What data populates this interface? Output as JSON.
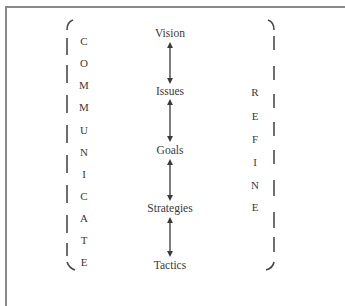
{
  "diagram": {
    "type": "flow",
    "left_label": {
      "word": "COMMUNICATE",
      "letters": [
        "C",
        "O",
        "M",
        "M",
        "U",
        "N",
        "I",
        "C",
        "A",
        "T",
        "E"
      ]
    },
    "right_label": {
      "word": "REFINE",
      "letters": [
        "R",
        "E",
        "F",
        "I",
        "N",
        "E"
      ]
    },
    "nodes": [
      {
        "id": "vision",
        "label": "Vision"
      },
      {
        "id": "issues",
        "label": "Issues"
      },
      {
        "id": "goals",
        "label": "Goals"
      },
      {
        "id": "strategies",
        "label": "Strategies"
      },
      {
        "id": "tactics",
        "label": "Tactics"
      }
    ],
    "edges": [
      {
        "from": "vision",
        "to": "issues",
        "style": "double-arrow"
      },
      {
        "from": "issues",
        "to": "goals",
        "style": "double-arrow"
      },
      {
        "from": "goals",
        "to": "strategies",
        "style": "double-arrow"
      },
      {
        "from": "strategies",
        "to": "tactics",
        "style": "double-arrow"
      }
    ],
    "colors": {
      "line": "#3a3a3a",
      "bracket": "#4a4a4a",
      "frame": "#8a8a8a",
      "text": "#3a3a3a"
    }
  }
}
